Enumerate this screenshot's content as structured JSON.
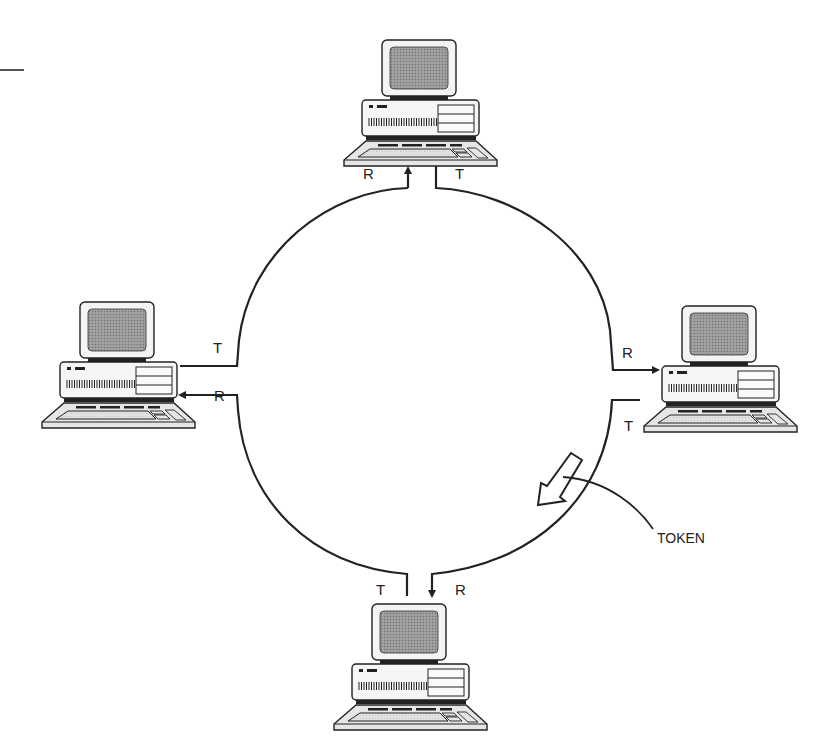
{
  "diagram": {
    "type": "token-ring-network",
    "colors": {
      "line": "#222222",
      "screen": "#8a8a8a",
      "body": "#f2f2f2",
      "keyboard": "#d8d8d8",
      "background": "#ffffff"
    },
    "ring": {
      "cx": 425,
      "cy": 380,
      "r": 192
    },
    "nodes": [
      {
        "id": "top",
        "position": "top",
        "receive_label": "R",
        "transmit_label": "T"
      },
      {
        "id": "right",
        "position": "right",
        "receive_label": "R",
        "transmit_label": "T"
      },
      {
        "id": "bottom",
        "position": "bottom",
        "receive_label": "R",
        "transmit_label": "T"
      },
      {
        "id": "left",
        "position": "left",
        "receive_label": "R",
        "transmit_label": "T"
      }
    ],
    "token": {
      "label": "TOKEN",
      "icon": "hollow-arrow-icon",
      "direction": "counter-clockwise"
    }
  }
}
